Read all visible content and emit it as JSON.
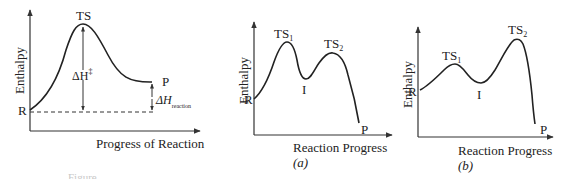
{
  "diagram_a_main": {
    "y_axis_label": "Enthalpy",
    "x_axis_label": "Progress of Reaction",
    "labels": {
      "reactant": "R",
      "transition_state": "TS",
      "product": "P",
      "activation": "ΔH",
      "activation_sup": "‡",
      "reaction_delta": "ΔH",
      "reaction_delta_sub": "reaction"
    }
  },
  "diagram_a": {
    "y_axis_label": "Enthalpy",
    "x_axis_label": "Reaction Progress",
    "caption": "(a)",
    "labels": {
      "reactant": "R",
      "ts1": "TS",
      "ts1_sub": "1",
      "intermediate": "I",
      "ts2": "TS",
      "ts2_sub": "2",
      "product": "P"
    }
  },
  "diagram_b": {
    "y_axis_label": "Enthalpy",
    "x_axis_label": "Reaction Progress",
    "caption": "(b)",
    "labels": {
      "reactant": "R",
      "ts1": "TS",
      "ts1_sub": "1",
      "intermediate": "I",
      "ts2": "TS",
      "ts2_sub": "2",
      "product": "P"
    }
  },
  "figure_caption_partial": "Figure"
}
